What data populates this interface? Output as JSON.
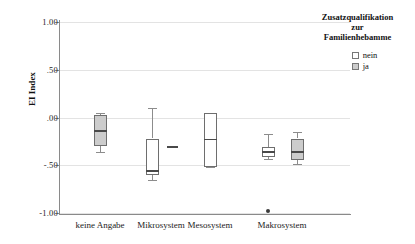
{
  "chart_data": {
    "type": "box",
    "title": "",
    "xlabel": "",
    "ylabel": "EI Index",
    "ylim": [
      -1.0,
      1.0
    ],
    "grid": true,
    "categories": [
      "keine Angabe",
      "Mikrosystem",
      "Mesosystem",
      "Makrosystem"
    ],
    "ytick_labels": [
      "1.00",
      ".50",
      ".00",
      "-.50",
      "-1.00"
    ],
    "ytick_values": [
      1.0,
      0.5,
      0.0,
      -0.5,
      -1.0
    ],
    "legend": {
      "title": "Zusatzqualifikation zur Familienhebamme",
      "title_lines": [
        "Zusatzqualifikation",
        "zur",
        "Familienhebamme"
      ],
      "position": "right-top",
      "entries": [
        {
          "label": "nein",
          "color": "#ffffff"
        },
        {
          "label": "ja",
          "color": "#cccccc"
        }
      ]
    },
    "series": [
      {
        "name": "nein",
        "color": "#ffffff",
        "boxes": [
          {
            "category": "Mikrosystem",
            "whisker_low": -0.65,
            "q1": -0.6,
            "median": -0.56,
            "q3": -0.22,
            "whisker_high": 0.1,
            "outliers": []
          },
          {
            "category": "Mesosystem",
            "whisker_low": -0.52,
            "q1": -0.52,
            "median": -0.23,
            "q3": 0.05,
            "whisker_high": 0.05,
            "outliers": []
          },
          {
            "category": "Makrosystem",
            "whisker_low": -0.43,
            "q1": -0.41,
            "median": -0.36,
            "q3": -0.31,
            "whisker_high": -0.17,
            "outliers": [
              -0.98
            ]
          }
        ]
      },
      {
        "name": "ja",
        "color": "#cccccc",
        "boxes": [
          {
            "category": "keine Angabe",
            "whisker_low": -0.36,
            "q1": -0.3,
            "median": -0.14,
            "q3": 0.03,
            "whisker_high": 0.05,
            "outliers": []
          },
          {
            "category": "Mikrosystem",
            "whisker_low": -0.31,
            "q1": -0.31,
            "median": -0.31,
            "q3": -0.31,
            "whisker_high": -0.31,
            "outliers": [],
            "degenerate": true
          },
          {
            "category": "Makrosystem",
            "whisker_low": -0.49,
            "q1": -0.45,
            "median": -0.36,
            "q3": -0.22,
            "whisker_high": -0.15,
            "outliers": []
          }
        ]
      }
    ]
  }
}
